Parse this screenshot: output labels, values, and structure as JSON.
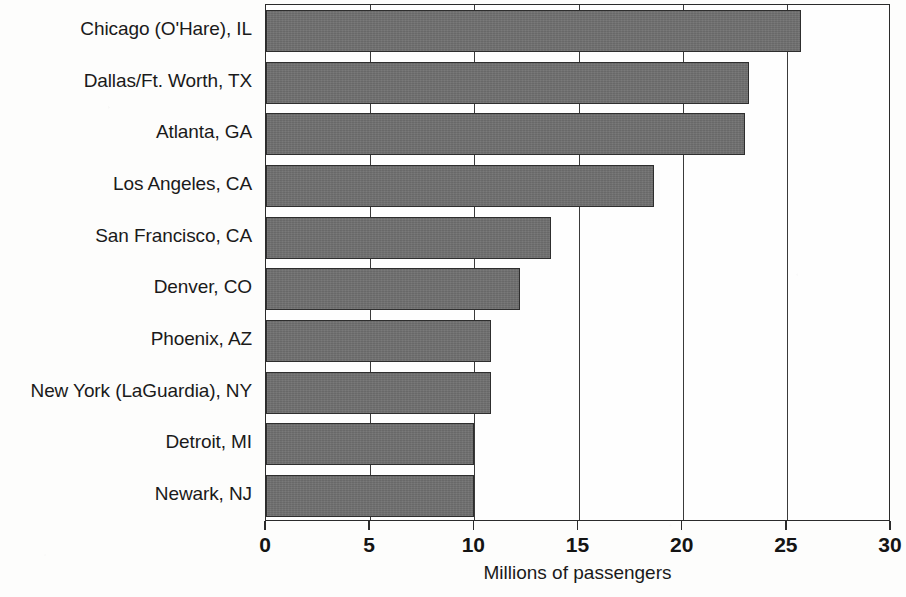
{
  "chart_data": {
    "type": "bar",
    "orientation": "horizontal",
    "title": "",
    "xlabel": "Millions of passengers",
    "ylabel": "",
    "xlim": [
      0,
      30
    ],
    "ylim": null,
    "grid": true,
    "legend": null,
    "xticks": [
      "0",
      "5",
      "10",
      "15",
      "20",
      "25",
      "30"
    ],
    "xtick_values": [
      0,
      5,
      10,
      15,
      20,
      25,
      30
    ],
    "categories": [
      "Chicago (O'Hare), IL",
      "Dallas/Ft. Worth, TX",
      "Atlanta, GA",
      "Los Angeles, CA",
      "San Francisco, CA",
      "Denver, CO",
      "Phoenix, AZ",
      "New York (LaGuardia), NY",
      "Detroit, MI",
      "Newark, NJ"
    ],
    "values": [
      25.7,
      23.2,
      23.0,
      18.6,
      13.7,
      12.2,
      10.8,
      10.8,
      10.0,
      10.0
    ],
    "bar_color": "#6f6f6f",
    "bar_border_color": "#2e2e2e",
    "axis_color": "#2b2b2b",
    "background_color": "#fdfdfc"
  }
}
